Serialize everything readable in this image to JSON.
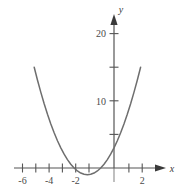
{
  "chart_data": {
    "type": "line",
    "title": "",
    "subtitle": "",
    "xlabel": "x",
    "ylabel": "y",
    "function": "y = x^2 + 4x + 3",
    "xlim": [
      -7.2,
      3.1
    ],
    "ylim": [
      -3.5,
      22.5
    ],
    "grid": false,
    "legend": null,
    "x_ticks": [
      -6,
      -5,
      -4,
      -3,
      -2,
      -1,
      1,
      2
    ],
    "x_tick_labels": [
      "-6",
      "",
      "-4",
      "",
      "-2",
      "",
      "",
      "2"
    ],
    "y_ticks": [
      5,
      10,
      15,
      20
    ],
    "y_tick_labels": [
      "",
      "10",
      "",
      "20"
    ],
    "series": [
      {
        "name": "parabola",
        "color": "#6e6e6e",
        "x": [
          -6.0,
          -5.75,
          -5.5,
          -5.25,
          -5.0,
          -4.75,
          -4.5,
          -4.25,
          -4.0,
          -3.75,
          -3.5,
          -3.25,
          -3.0,
          -2.75,
          -2.5,
          -2.25,
          -2.0,
          -1.75,
          -1.5,
          -1.25,
          -1.0,
          -0.75,
          -0.5,
          -0.25,
          0.0,
          0.25,
          0.5,
          0.75,
          1.0,
          1.25,
          1.5,
          1.75,
          2.0
        ],
        "y": [
          15.0,
          13.06,
          11.25,
          9.56,
          8.0,
          6.56,
          5.25,
          4.06,
          3.0,
          2.06,
          1.25,
          0.56,
          0.0,
          -0.44,
          -0.75,
          -0.94,
          -1.0,
          -0.94,
          -0.75,
          -0.44,
          0.0,
          0.56,
          1.25,
          2.06,
          3.0,
          4.06,
          5.25,
          6.56,
          8.0,
          9.56,
          11.25,
          13.06,
          15.0
        ]
      }
    ],
    "vertex": [
      -2,
      -1
    ],
    "x_intercepts": [
      -3,
      -1
    ],
    "y_intercept": 3
  },
  "axes": {
    "x_axis_label": "x",
    "y_axis_label": "y",
    "axis_color": "#555555",
    "curve_color": "#6e6e6e",
    "y_axis_lower_color": "#aaaaaa"
  }
}
